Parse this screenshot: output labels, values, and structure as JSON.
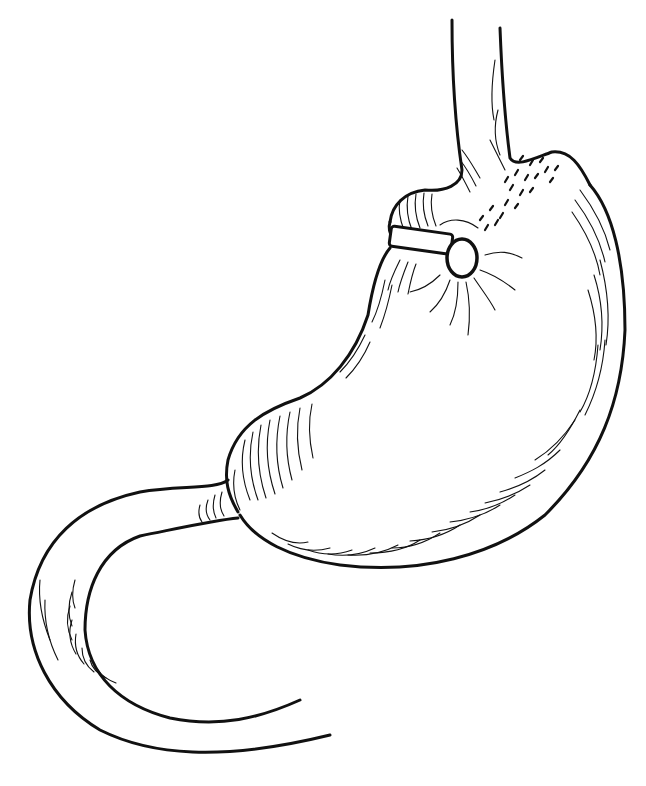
{
  "illustration": {
    "subject": "stomach with adjustable gastric band",
    "background": "#ffffff",
    "ink": "#111111",
    "parts": {
      "esophagus": {
        "left": "M452 20 C452 80 456 130 462 170 C462 185 445 192 425 190 C405 192 392 205 390 222",
        "right": "M500 28 C502 80 505 120 510 158 C516 168 535 158 552 152 C570 150 580 165 590 185"
      },
      "stomach_greater_curvature": "M590 185 C612 210 625 260 625 330 C622 400 600 460 545 515 C495 555 420 575 340 565 C290 558 255 540 240 515",
      "stomach_lesser_curvature": "M390 248 C378 262 372 290 368 315 C355 355 330 385 300 398 C265 410 238 425 228 460 C224 480 228 495 238 512",
      "duodenum_outer": "M228 480 C215 490 180 485 140 492 C80 505 40 540 30 600 C25 650 50 700 100 730 C150 755 220 762 330 735",
      "duodenum_inner": "M238 518 C215 520 180 528 140 536 C100 550 85 590 85 630 C88 675 120 705 170 718 C220 728 260 718 300 700",
      "gastric_band": {
        "x": 390,
        "y": 230,
        "width": 66,
        "height": 22,
        "rotate": 8
      },
      "band_ring": {
        "cx": 462,
        "cy": 258,
        "rx": 15,
        "ry": 19
      }
    }
  }
}
